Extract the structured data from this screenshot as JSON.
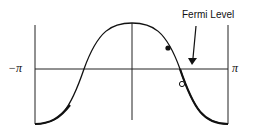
{
  "diagram": {
    "type": "band-structure",
    "curve": "cosine band E(k) = -cos-like over k in [-π, π]",
    "x_axis": {
      "left_label": "−π",
      "right_label": "π"
    },
    "annotation": {
      "label": "Fermi Level",
      "arrow_target": "horizontal axis near k ≈ 0.65π"
    },
    "points": [
      {
        "kind": "filled",
        "description": "occupied state above axis"
      },
      {
        "kind": "open",
        "description": "empty state below axis"
      }
    ],
    "colors": {
      "line": "#111111",
      "background": "#ffffff"
    }
  }
}
